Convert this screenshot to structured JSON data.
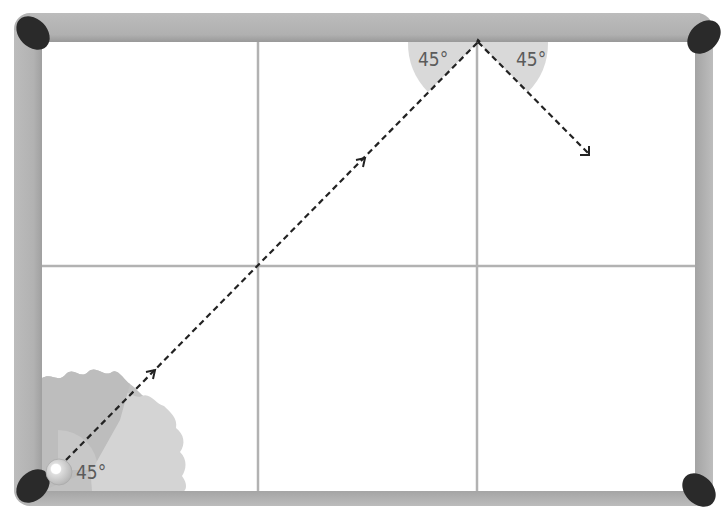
{
  "diagram": {
    "title": "",
    "table": {
      "grid": {
        "columns": 3,
        "rows": 2
      },
      "pockets": [
        "top-left",
        "top-right",
        "bottom-left",
        "bottom-right"
      ]
    },
    "angles": {
      "start_angle": "45°",
      "incidence_angle": "45°",
      "reflection_angle": "45°"
    },
    "path": {
      "segments": [
        {
          "from": "bottom-left corner (ball)",
          "to": "top rail",
          "direction": "up-right"
        },
        {
          "from": "top rail",
          "to": "interior",
          "direction": "down-right"
        }
      ]
    },
    "colors": {
      "rail": "#b3b3b3",
      "rail_shadow": "#9e9e9e",
      "pocket": "#2b2b2b",
      "grid_line": "#b0b0b0",
      "felt": "#ffffff",
      "angle_wedge": "#d9d9d9",
      "splotch_dark": "#bdbdbd",
      "splotch_light": "#d3d3d3",
      "path": "#222222",
      "ball": "#d6d6d6"
    }
  }
}
